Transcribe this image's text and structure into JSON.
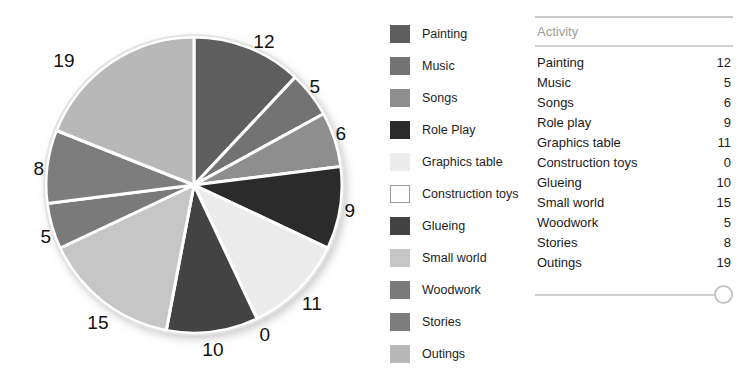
{
  "chart_data": {
    "type": "pie",
    "title": "",
    "categories": [
      "Painting",
      "Music",
      "Songs",
      "Role Play",
      "Graphics table",
      "Construction toys",
      "Glueing",
      "Small world",
      "Woodwork",
      "Stories",
      "Outings"
    ],
    "values": [
      12,
      5,
      6,
      9,
      11,
      0,
      10,
      15,
      5,
      8,
      19
    ],
    "data_labels": [
      "12",
      "5",
      "6",
      "9",
      "11",
      "0",
      "10",
      "15",
      "5",
      "8",
      "19"
    ],
    "total": 100,
    "start_angle_deg": 0,
    "direction": "clockwise",
    "legend_position": "right",
    "grid": false,
    "slice_colors": [
      "#5e5e5e",
      "#737373",
      "#8e8e8e",
      "#2b2b2b",
      "#ececec",
      "#ffffff",
      "#434343",
      "#c6c6c6",
      "#7a7a7a",
      "#7d7d7d",
      "#b8b8b8"
    ]
  },
  "pie": {
    "labels": [
      {
        "text": "12",
        "x": 264,
        "y": 41
      },
      {
        "text": "5",
        "x": 315,
        "y": 86
      },
      {
        "text": "6",
        "x": 341,
        "y": 133
      },
      {
        "text": "9",
        "x": 350,
        "y": 210
      },
      {
        "text": "11",
        "x": 312,
        "y": 303
      },
      {
        "text": "0",
        "x": 265,
        "y": 334
      },
      {
        "text": "10",
        "x": 213,
        "y": 349
      },
      {
        "text": "15",
        "x": 98,
        "y": 322
      },
      {
        "text": "5",
        "x": 46,
        "y": 236
      },
      {
        "text": "8",
        "x": 39,
        "y": 168
      },
      {
        "text": "19",
        "x": 64,
        "y": 60
      }
    ]
  },
  "legend": {
    "items": [
      {
        "label": "Painting",
        "color": "#5e5e5e",
        "outlined": false
      },
      {
        "label": "Music",
        "color": "#737373",
        "outlined": false
      },
      {
        "label": "Songs",
        "color": "#8e8e8e",
        "outlined": false
      },
      {
        "label": "Role Play",
        "color": "#2b2b2b",
        "outlined": false
      },
      {
        "label": "Graphics table",
        "color": "#ececec",
        "outlined": false
      },
      {
        "label": "Construction toys",
        "color": "#ffffff",
        "outlined": true
      },
      {
        "label": "Glueing",
        "color": "#434343",
        "outlined": false
      },
      {
        "label": "Small world",
        "color": "#c6c6c6",
        "outlined": false
      },
      {
        "label": "Woodwork",
        "color": "#7a7a7a",
        "outlined": false
      },
      {
        "label": "Stories",
        "color": "#7d7d7d",
        "outlined": false
      },
      {
        "label": "Outings",
        "color": "#b8b8b8",
        "outlined": false
      }
    ]
  },
  "table": {
    "header": "Activity",
    "rows": [
      {
        "activity": "Painting",
        "count": "12"
      },
      {
        "activity": "Music",
        "count": "5"
      },
      {
        "activity": "Songs",
        "count": "6"
      },
      {
        "activity": "Role play",
        "count": "9"
      },
      {
        "activity": "Graphics table",
        "count": "11"
      },
      {
        "activity": "Construction toys",
        "count": "0"
      },
      {
        "activity": "Glueing",
        "count": "10"
      },
      {
        "activity": "Small world",
        "count": "15"
      },
      {
        "activity": "Woodwork",
        "count": "5"
      },
      {
        "activity": "Stories",
        "count": "8"
      },
      {
        "activity": "Outings",
        "count": "19"
      }
    ]
  },
  "slider": {
    "value": 100,
    "min": 0,
    "max": 100
  }
}
